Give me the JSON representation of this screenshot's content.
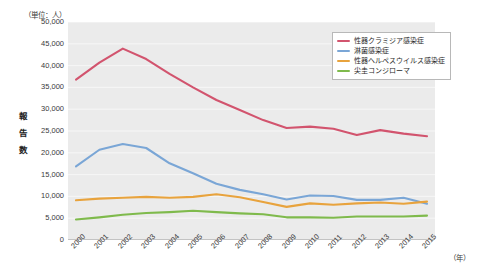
{
  "chart_data": {
    "type": "line",
    "title": "",
    "unit_note": "（単位：人）",
    "ylabel": "報告数",
    "xlabel": "（年）",
    "ylim": [
      0,
      50000
    ],
    "ytick_labels": [
      "50,000",
      "45,000",
      "40,000",
      "35,000",
      "30,000",
      "25,000",
      "20,000",
      "15,000",
      "10,000",
      "5,000",
      "0"
    ],
    "ytick_values": [
      50000,
      45000,
      40000,
      35000,
      30000,
      25000,
      20000,
      15000,
      10000,
      5000,
      0
    ],
    "grid": true,
    "legend_position": "top-right",
    "categories": [
      "2000",
      "2001",
      "2002",
      "2003",
      "2004",
      "2005",
      "2006",
      "2007",
      "2008",
      "2009",
      "2010",
      "2011",
      "2012",
      "2013",
      "2014",
      "2015"
    ],
    "x": [
      2000,
      2001,
      2002,
      2003,
      2004,
      2005,
      2006,
      2007,
      2008,
      2009,
      2010,
      2011,
      2012,
      2013,
      2014,
      2015
    ],
    "series": [
      {
        "name": "性器クラミジア感染症",
        "color": "#d2546e",
        "values": [
          36800,
          40700,
          43900,
          41500,
          38100,
          35000,
          32100,
          29800,
          27500,
          25700,
          26000,
          25500,
          24100,
          25200,
          24400,
          23800
        ]
      },
      {
        "name": "淋菌感染症",
        "color": "#7aa6d6",
        "values": [
          16900,
          20700,
          22000,
          21100,
          17600,
          15300,
          12900,
          11500,
          10500,
          9300,
          10200,
          10100,
          9200,
          9200,
          9700,
          8300
        ]
      },
      {
        "name": "性器ヘルペスウイルス感染症",
        "color": "#e8a33d",
        "values": [
          9100,
          9500,
          9700,
          9900,
          9700,
          9900,
          10500,
          9800,
          8700,
          7600,
          8400,
          8100,
          8400,
          8600,
          8300,
          8800
        ]
      },
      {
        "name": "尖圭コンジローマ",
        "color": "#7fba4c",
        "values": [
          4700,
          5200,
          5800,
          6200,
          6400,
          6700,
          6400,
          6100,
          5900,
          5200,
          5200,
          5100,
          5400,
          5400,
          5400,
          5600
        ]
      }
    ]
  },
  "legend": {
    "items": [
      {
        "label": "性器クラミジア感染症",
        "color": "#d2546e"
      },
      {
        "label": "淋菌感染症",
        "color": "#7aa6d6"
      },
      {
        "label": "性器ヘルペスウイルス感染症",
        "color": "#e8a33d"
      },
      {
        "label": "尖圭コンジローマ",
        "color": "#7fba4c"
      }
    ]
  }
}
